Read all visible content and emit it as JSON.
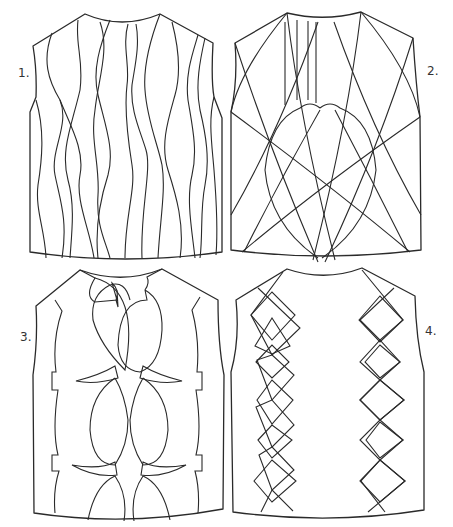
{
  "figure": {
    "stroke_color": "#2a2a2a",
    "background": "#ffffff",
    "panels": [
      {
        "id": 1,
        "label": "1.",
        "pattern": "wavy vertical cables"
      },
      {
        "id": 2,
        "label": "2.",
        "pattern": "crossing arcs with heart-shaped center and vertical neck lines"
      },
      {
        "id": 3,
        "label": "3.",
        "pattern": "interlocking lens/bracket cables with side notches"
      },
      {
        "id": 4,
        "label": "4.",
        "pattern": "two vertical columns of argyle diamonds"
      }
    ]
  }
}
